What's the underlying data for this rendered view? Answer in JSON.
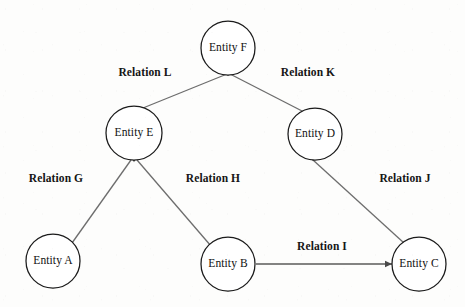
{
  "diagram": {
    "type": "entity-relationship-graph",
    "canvas": {
      "width": 465,
      "height": 307
    },
    "colors": {
      "background": "#fdfdfc",
      "node_stroke": "#1b1b1b",
      "node_fill": "#ffffff",
      "edge_stroke": "#6d6d6d",
      "arrow_fill": "#4a4a4a",
      "text": "#111111"
    },
    "nodes": [
      {
        "id": "F",
        "label": "Entity F",
        "cx": 228,
        "cy": 48,
        "rx": 27,
        "ry": 27
      },
      {
        "id": "E",
        "label": "Entity E",
        "cx": 134,
        "cy": 133,
        "rx": 28,
        "ry": 27
      },
      {
        "id": "D",
        "label": "Entity D",
        "cx": 315,
        "cy": 134,
        "rx": 27,
        "ry": 26
      },
      {
        "id": "A",
        "label": "Entity A",
        "cx": 53,
        "cy": 261,
        "rx": 27,
        "ry": 27
      },
      {
        "id": "B",
        "label": "Entity B",
        "cx": 228,
        "cy": 264,
        "rx": 27,
        "ry": 27
      },
      {
        "id": "C",
        "label": "Entity C",
        "cx": 419,
        "cy": 264,
        "rx": 27,
        "ry": 27
      }
    ],
    "edges": [
      {
        "id": "L",
        "label": "Relation L",
        "from": "F",
        "to": "E",
        "x1": 227,
        "y1": 74,
        "x2": 143,
        "y2": 108,
        "label_x": 145,
        "label_y": 73,
        "arrow": "none"
      },
      {
        "id": "K",
        "label": "Relation K",
        "from": "F",
        "to": "D",
        "x1": 230,
        "y1": 74,
        "x2": 304,
        "y2": 112,
        "label_x": 308,
        "label_y": 73,
        "arrow": "none"
      },
      {
        "id": "G",
        "label": "Relation G",
        "from": "E",
        "to": "A",
        "x1": 131,
        "y1": 160,
        "x2": 72,
        "y2": 243,
        "label_x": 56,
        "label_y": 179,
        "arrow": "none"
      },
      {
        "id": "H",
        "label": "Relation H",
        "from": "E",
        "to": "B",
        "x1": 137,
        "y1": 160,
        "x2": 211,
        "y2": 246,
        "label_x": 213,
        "label_y": 179,
        "arrow": "none"
      },
      {
        "id": "J",
        "label": "Relation J",
        "from": "D",
        "to": "C",
        "x1": 313,
        "y1": 160,
        "x2": 404,
        "y2": 243,
        "label_x": 405,
        "label_y": 179,
        "arrow": "none"
      },
      {
        "id": "I",
        "label": "Relation I",
        "from": "B",
        "to": "C",
        "x1": 256,
        "y1": 264,
        "x2": 392,
        "y2": 264,
        "label_x": 322,
        "label_y": 247,
        "arrow": "end"
      }
    ],
    "junction_markers": [
      {
        "at_node": "F",
        "x": 228,
        "y": 74
      },
      {
        "at_node": "E",
        "x": 134,
        "y": 160
      },
      {
        "at_node": "D",
        "x": 313,
        "y": 159
      }
    ]
  }
}
